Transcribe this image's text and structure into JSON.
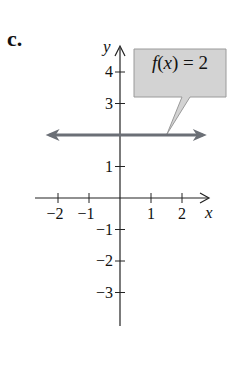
{
  "part_label": "c.",
  "chart_data": {
    "type": "line",
    "title": "",
    "function_label": "f(x) = 2",
    "function_label_parts": {
      "f": "f",
      "open": "(",
      "x": "x",
      "close_eq": ") = 2"
    },
    "xlabel": "x",
    "ylabel": "y",
    "x_ticks": [
      -2,
      -1,
      1,
      2
    ],
    "x_tick_labels": [
      "−2",
      "−1",
      "1",
      "2"
    ],
    "y_ticks": [
      4,
      3,
      1,
      -1,
      -2,
      -3
    ],
    "y_tick_labels": [
      "4",
      "3",
      "1",
      "−1",
      "−2",
      "−3"
    ],
    "xlim": [
      -2.5,
      3
    ],
    "ylim": [
      -4,
      5
    ],
    "series": [
      {
        "name": "f(x) = 2",
        "kind": "horizontal-line",
        "y": 2,
        "x_range": [
          -2.4,
          2.8
        ],
        "arrows": "both"
      }
    ],
    "grid": false,
    "legend": "callout"
  },
  "colors": {
    "line": "#6b6f76",
    "axis": "#222222",
    "callout_fill": "#d3d3d3",
    "callout_stroke": "#9a9a9a",
    "text": "#111111"
  }
}
